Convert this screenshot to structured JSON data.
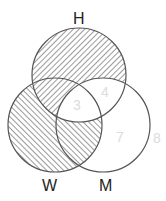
{
  "diagram": {
    "type": "venn-3",
    "sets": [
      {
        "label": "H",
        "cx": 79,
        "cy": 75,
        "r": 47
      },
      {
        "label": "W",
        "cx": 55,
        "cy": 125,
        "r": 47
      },
      {
        "label": "M",
        "cx": 103,
        "cy": 125,
        "r": 47
      }
    ],
    "labels": {
      "H": "H",
      "W": "W",
      "M": "M"
    },
    "region_numbers": {
      "center_HWM": "3",
      "H_and_M": "4",
      "M_only": "7",
      "outside": "8"
    },
    "shading": {
      "H_only": "hatch-forward",
      "H_and_W": "hatch-forward",
      "W_only": "hatch-back",
      "W_and_M": "hatch-back",
      "H_and_M": "none",
      "center_HWM": "none",
      "M_only": "none"
    },
    "colors": {
      "stroke": "#555555",
      "hatch": "#555555",
      "number": "#dcdcdc",
      "label": "#222222"
    }
  }
}
